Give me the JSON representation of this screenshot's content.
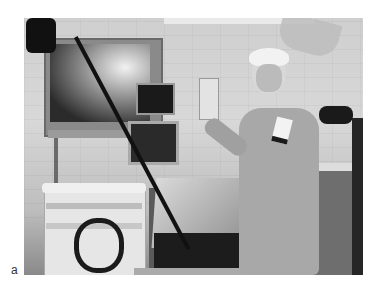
{
  "figure": {
    "panel_label": "a",
    "image_type": "grayscale photograph",
    "scene": {
      "setting": "endoscopy procedure room",
      "objects": [
        "large video monitor",
        "small monitors",
        "endoscope with cable",
        "endoscopy equipment cart",
        "training table with simulator box",
        "surgeon in scrubs with cap and name badge",
        "IV pole",
        "ceiling surgical lamp",
        "side counter"
      ]
    }
  }
}
